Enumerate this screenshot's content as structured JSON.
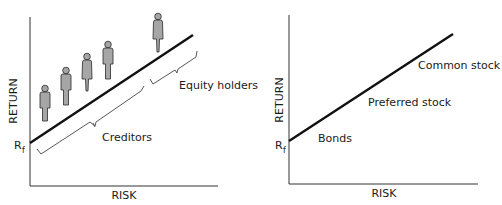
{
  "left_chart": {
    "y_axis_label": "RETURN",
    "x_axis_label": "RISK",
    "intercept_label": "R",
    "intercept_subscript": "f",
    "brackets": [
      {
        "label": "Creditors"
      },
      {
        "label": "Equity holders"
      }
    ],
    "people_count": 5
  },
  "right_chart": {
    "y_axis_label": "RETURN",
    "x_axis_label": "RISK",
    "intercept_label": "R",
    "intercept_subscript": "f",
    "segments": [
      {
        "label": "Bonds"
      },
      {
        "label": "Preferred stock"
      },
      {
        "label": "Common stock"
      }
    ]
  },
  "colors": {
    "line": "#111111",
    "axis": "#333333",
    "person_fill": "#a6a6a6",
    "person_stroke": "#2a2a2a",
    "text": "#1a1a1a"
  }
}
